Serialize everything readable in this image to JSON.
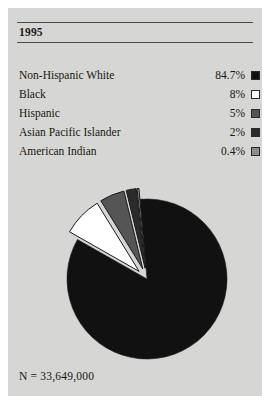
{
  "figure": {
    "year_title": "1995",
    "n_label": "N = 33,649,000",
    "panel_background": "#d6d6d4",
    "rule_color": "#4a4a4a"
  },
  "legend": {
    "rows": [
      {
        "label": "Non-Hispanic White",
        "value": "84.7%",
        "swatch": "#111111",
        "swatch_name": "swatch-non-hispanic-white"
      },
      {
        "label": "Black",
        "value": "8%",
        "swatch": "#ffffff",
        "swatch_name": "swatch-black"
      },
      {
        "label": "Hispanic",
        "value": "5%",
        "swatch": "#555555",
        "swatch_name": "swatch-hispanic"
      },
      {
        "label": "Asian Pacific Islander",
        "value": "2%",
        "swatch": "#2b2b2b",
        "swatch_name": "swatch-asian-pacific-islander"
      },
      {
        "label": "American Indian",
        "value": "0.4%",
        "swatch": "#8c8c8c",
        "swatch_name": "swatch-american-indian"
      }
    ]
  },
  "chart_data": {
    "type": "pie",
    "title": "1995",
    "xlabel": "",
    "ylabel": "",
    "legend_position": "top",
    "grid": false,
    "total_label": "N = 33,649,000",
    "total_value": 33649000,
    "categories": [
      "Non-Hispanic White",
      "Black",
      "Hispanic",
      "Asian Pacific Islander",
      "American Indian"
    ],
    "values": [
      84.7,
      8,
      5,
      2,
      0.4
    ],
    "value_labels": [
      "84.7%",
      "8%",
      "5%",
      "2%",
      "0.4%"
    ],
    "colors": [
      "#111111",
      "#ffffff",
      "#555555",
      "#2b2b2b",
      "#8c8c8c"
    ],
    "exploded": [
      false,
      true,
      true,
      true,
      true
    ],
    "units": "percent"
  }
}
